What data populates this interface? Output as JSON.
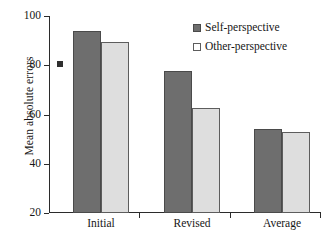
{
  "chart_data": {
    "type": "bar",
    "title": "",
    "xlabel": "",
    "ylabel": "Mean absolute errors",
    "categories": [
      "Initial",
      "Revised",
      "Average"
    ],
    "series": [
      {
        "name": "Self-perspective",
        "color": "#6e6e6e",
        "values": [
          94,
          77.5,
          54
        ]
      },
      {
        "name": "Other-perspective",
        "color": "#dedede",
        "values": [
          89.5,
          62.5,
          53
        ]
      }
    ],
    "ylim": [
      20,
      100
    ],
    "yticks": [
      20,
      40,
      60,
      80,
      100
    ],
    "ytick_labels": [
      "20",
      "40",
      "60",
      "80",
      "100"
    ],
    "grid": false,
    "legend_position": "top-right",
    "annotations": [
      "error-marker at 80 on y-axis"
    ]
  }
}
